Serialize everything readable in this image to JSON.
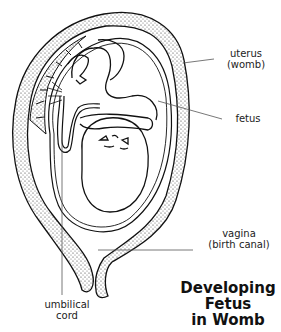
{
  "diagram": {
    "title_lines": [
      "Developing",
      "Fetus",
      "in Womb"
    ],
    "labels": {
      "uterus": {
        "line1": "uterus",
        "line2": "(womb)"
      },
      "fetus": {
        "line1": "fetus"
      },
      "vagina": {
        "line1": "vagina",
        "line2": "(birth canal)"
      },
      "umbilical_cord": {
        "line1": "umbilical",
        "line2": "cord"
      }
    },
    "colors": {
      "ink": "#111111",
      "background": "#ffffff",
      "leader_line": "#555555"
    }
  }
}
